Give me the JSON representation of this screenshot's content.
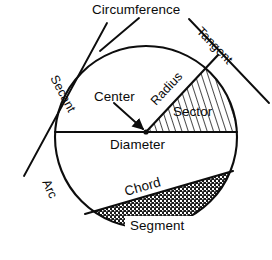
{
  "diagram": {
    "type": "geometry-diagram",
    "background_color": "#ffffff",
    "line_color": "#0d0d0d",
    "circle": {
      "cx": 146,
      "cy": 137,
      "r": 91
    },
    "labels": {
      "circumference": "Circumference",
      "secant": "Secant",
      "tangent": "Tangent",
      "radius": "Radius",
      "center": "Center",
      "sector": "Sector",
      "diameter": "Diameter",
      "arc": "Arc",
      "chord": "Chord",
      "segment": "Segment"
    },
    "regions": [
      {
        "name": "sector",
        "fill": "diagonal-hatch",
        "label": "Sector"
      },
      {
        "name": "segment",
        "fill": "stipple-crosshatch",
        "label": "Segment"
      }
    ],
    "lines": [
      {
        "name": "diameter",
        "from": [
          55,
          132
        ],
        "to": [
          237,
          132
        ]
      },
      {
        "name": "radius",
        "from": [
          146,
          132
        ],
        "to": [
          218,
          55
        ]
      },
      {
        "name": "chord",
        "from": [
          85,
          214
        ],
        "to": [
          233,
          171
        ]
      },
      {
        "name": "secant",
        "from": [
          24,
          176
        ],
        "to": [
          107,
          23
        ]
      },
      {
        "name": "tangent",
        "from": [
          189,
          19
        ],
        "to": [
          269,
          103
        ]
      },
      {
        "name": "circumference-leader",
        "from": [
          139,
          17
        ],
        "to": [
          99,
          52
        ]
      },
      {
        "name": "center-arrow",
        "from": [
          115,
          104
        ],
        "to": [
          146,
          131
        ]
      }
    ]
  }
}
